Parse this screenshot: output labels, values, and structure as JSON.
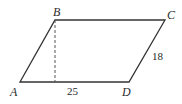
{
  "figure": {
    "shape": "parallelogram",
    "vertices": {
      "A": {
        "label": "A",
        "x": 20,
        "y": 82
      },
      "B": {
        "label": "B",
        "x": 55,
        "y": 20
      },
      "C": {
        "label": "C",
        "x": 165,
        "y": 20
      },
      "D": {
        "label": "D",
        "x": 129,
        "y": 82
      }
    },
    "measurements": {
      "base_segment": "25",
      "side_CD": "18"
    },
    "height_line": {
      "style": "dashed",
      "from": "B",
      "to_foot_on": "AD"
    },
    "colors": {
      "stroke": "#333333",
      "background": "#ffffff"
    }
  }
}
